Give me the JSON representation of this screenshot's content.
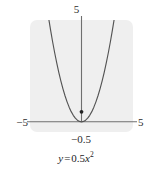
{
  "figure": {
    "caption": {
      "lhs": "y",
      "equals": "=",
      "coefficient": "0.5",
      "variable": "x",
      "exponent": "2",
      "full_text": "y = 0.5x²"
    },
    "panel": {
      "background_color": "#efefef",
      "corner_radius": 7
    },
    "axes": {
      "x_axis_color": "#6f6f6f",
      "y_axis_color": "#6f6f6f",
      "y_top_label": "5",
      "x_left_label": "−5",
      "x_right_label": "5",
      "vertex_label": "−0.5"
    }
  },
  "chart_data": {
    "type": "line",
    "title": "",
    "subtitle": "",
    "xlabel": "",
    "ylabel": "",
    "equation": "y = 0.5x^2",
    "curve_color": "#545454",
    "point_color": "#242424",
    "grid": false,
    "legend": null,
    "xlim": [
      -5,
      5
    ],
    "ylim": [
      -0.5,
      5
    ],
    "xticks": [
      -5,
      5
    ],
    "yticks": [
      5
    ],
    "xtick_labels": [
      "−5",
      "5"
    ],
    "ytick_labels": [
      "5"
    ],
    "annotations": [
      {
        "text": "−0.5",
        "x": 0,
        "y": -0.5,
        "role": "y-axis-minimum-label"
      }
    ],
    "points": [
      {
        "x": 0,
        "y": 0,
        "label": "vertex",
        "marker": "filled-circle"
      }
    ],
    "series": [
      {
        "name": "y = 0.5x²",
        "x": [
          -3.2,
          -3.0,
          -2.8,
          -2.6,
          -2.4,
          -2.2,
          -2.0,
          -1.8,
          -1.6,
          -1.4,
          -1.2,
          -1.0,
          -0.8,
          -0.6,
          -0.4,
          -0.2,
          0.0,
          0.2,
          0.4,
          0.6,
          0.8,
          1.0,
          1.2,
          1.4,
          1.6,
          1.8,
          2.0,
          2.2,
          2.4,
          2.6,
          2.8,
          3.0,
          3.2
        ],
        "y": [
          5.12,
          4.5,
          3.92,
          3.38,
          2.88,
          2.42,
          2.0,
          1.62,
          1.28,
          0.98,
          0.72,
          0.5,
          0.32,
          0.18,
          0.08,
          0.02,
          0.0,
          0.02,
          0.08,
          0.18,
          0.32,
          0.5,
          0.72,
          0.98,
          1.28,
          1.62,
          2.0,
          2.42,
          2.88,
          3.38,
          3.92,
          4.5,
          5.12
        ]
      }
    ]
  }
}
